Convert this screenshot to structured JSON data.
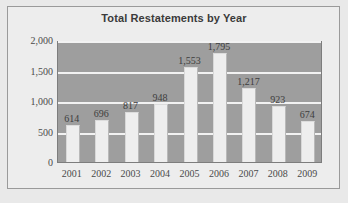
{
  "chart_data": {
    "type": "bar",
    "title": "Total Restatements by Year",
    "xlabel": "",
    "ylabel": "",
    "categories": [
      "2001",
      "2002",
      "2003",
      "2004",
      "2005",
      "2006",
      "2007",
      "2008",
      "2009"
    ],
    "values": [
      614,
      696,
      817,
      948,
      1553,
      1795,
      1217,
      923,
      674
    ],
    "data_labels": [
      "614",
      "696",
      "817",
      "948",
      "1,553",
      "1,795",
      "1,217",
      "923",
      "674"
    ],
    "ylim": [
      0,
      2000
    ],
    "yticks": [
      0,
      500,
      1000,
      1500,
      2000
    ],
    "ytick_labels": [
      "0",
      "500",
      "1,000",
      "1,500",
      "2,000"
    ],
    "grid": true,
    "grid_axis": "y",
    "legend": false,
    "legend_position": "none",
    "colors": {
      "bar_fill": "#eeeeee",
      "plot_background": "#9e9e9e",
      "figure_background": "#e9e9e9",
      "gridline": "#f2f2f2",
      "text": "#3d3d3d",
      "frame_border": "#9a9a9a"
    }
  }
}
